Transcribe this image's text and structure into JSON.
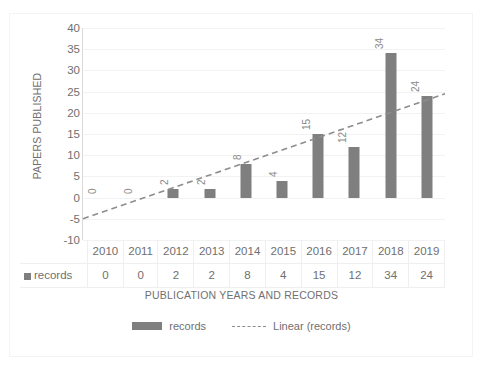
{
  "chart_data": {
    "type": "bar",
    "title": "",
    "subtitle": "",
    "xlabel": "PUBLICATION YEARS AND RECORDS",
    "ylabel": "PAPERS PUBLISHED",
    "categories": [
      "2010",
      "2011",
      "2012",
      "2013",
      "2014",
      "2015",
      "2016",
      "2017",
      "2018",
      "2019"
    ],
    "series": [
      {
        "name": "records",
        "type": "bar",
        "values": [
          0,
          0,
          2,
          2,
          8,
          4,
          15,
          12,
          34,
          24
        ],
        "color": "#7f7f7f",
        "data_labels": [
          "0",
          "0",
          "2",
          "2",
          "8",
          "4",
          "15",
          "12",
          "34",
          "24"
        ],
        "data_label_rotation": "-90"
      },
      {
        "name": "Linear (records)",
        "type": "trendline",
        "style": "dashed",
        "color": "#8d8d8d",
        "start_value": -5,
        "end_value": 24.5
      }
    ],
    "ylim": [
      -10,
      40
    ],
    "ytick_step": 5,
    "yticks": [
      "40",
      "35",
      "30",
      "25",
      "20",
      "15",
      "10",
      "5",
      "0",
      "-5",
      "-10"
    ],
    "grid": true,
    "grid_axis": "y",
    "legend_position": "bottom",
    "data_table_visible": true
  },
  "data_table": {
    "row_label": "records",
    "legend_marker": "square-marker",
    "columns": [
      "2010",
      "2011",
      "2012",
      "2013",
      "2014",
      "2015",
      "2016",
      "2017",
      "2018",
      "2019"
    ],
    "values": [
      "0",
      "0",
      "2",
      "2",
      "8",
      "4",
      "15",
      "12",
      "34",
      "24"
    ]
  },
  "legend": {
    "items": [
      {
        "label": "records",
        "marker": "bar-swatch",
        "color": "#7f7f7f"
      },
      {
        "label": "Linear (records)",
        "marker": "dashed-line-swatch",
        "color": "#8d8d8d"
      }
    ]
  },
  "axes": {
    "y_title": "PAPERS PUBLISHED",
    "x_title": "PUBLICATION YEARS AND RECORDS"
  },
  "colors": {
    "bar": "#7f7f7f",
    "trendline": "#8d8d8d",
    "text": "#6f6f6f",
    "gridline": "#f2f2f2",
    "background": "#ffffff"
  }
}
